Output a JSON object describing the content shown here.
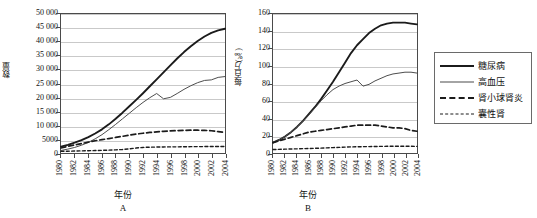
{
  "figure": {
    "panels": [
      {
        "letter": "A",
        "ylabel": "数量",
        "xlabel": "年份",
        "yticks": [
          "0",
          "5000",
          "10 000",
          "15 000",
          "20 000",
          "25 000",
          "30 000",
          "35 000",
          "40 000",
          "45 000",
          "50 000"
        ]
      },
      {
        "letter": "B",
        "ylabel": "每百万(‰)",
        "xlabel": "年份",
        "yticks": [
          "0",
          "20",
          "40",
          "60",
          "80",
          "100",
          "120",
          "140",
          "160"
        ]
      }
    ],
    "xticks": [
      "1980",
      "1982",
      "1984",
      "1986",
      "1988",
      "1990",
      "1992",
      "1994",
      "1996",
      "1998",
      "2000",
      "2002",
      "2004"
    ]
  },
  "legend": {
    "items": [
      {
        "label": "糖尿病",
        "style": "solid-thick",
        "color": "#1b1b1b"
      },
      {
        "label": "高血压",
        "style": "solid-thin",
        "color": "#4a4a4a"
      },
      {
        "label": "肾小球肾炎",
        "style": "dashed",
        "color": "#1b1b1b"
      },
      {
        "label": "囊性肾",
        "style": "dotted",
        "color": "#1b1b1b"
      }
    ]
  },
  "chart_data": [
    {
      "type": "line",
      "panel": "A",
      "title": "",
      "xlabel": "年份",
      "ylabel": "数量",
      "xlim": [
        1980,
        2004
      ],
      "ylim": [
        0,
        50000
      ],
      "grid": true,
      "legend_position": "right-outside",
      "x": [
        1980,
        1981,
        1982,
        1983,
        1984,
        1985,
        1986,
        1987,
        1988,
        1989,
        1990,
        1991,
        1992,
        1993,
        1994,
        1995,
        1996,
        1997,
        1998,
        1999,
        2000,
        2001,
        2002,
        2003,
        2004
      ],
      "series": [
        {
          "name": "糖尿病",
          "style": "solid-thick",
          "values": [
            2300,
            2900,
            3700,
            4600,
            5700,
            7000,
            8500,
            10300,
            12300,
            14500,
            16800,
            19100,
            21500,
            24000,
            26500,
            29000,
            31500,
            34000,
            36300,
            38400,
            40300,
            41900,
            43200,
            44100,
            44700
          ]
        },
        {
          "name": "高血压",
          "style": "solid-thin",
          "values": [
            900,
            1400,
            2000,
            2800,
            3800,
            5100,
            6600,
            8400,
            10300,
            12300,
            14300,
            16300,
            18200,
            19900,
            21400,
            19500,
            20000,
            21400,
            22900,
            24200,
            25300,
            26100,
            26300,
            27200,
            27500
          ]
        },
        {
          "name": "肾小球肾炎",
          "style": "dashed",
          "values": [
            1800,
            2400,
            2900,
            3400,
            3900,
            4400,
            4800,
            5200,
            5600,
            6000,
            6400,
            6800,
            7100,
            7400,
            7600,
            7800,
            7950,
            8050,
            8150,
            8200,
            8200,
            8150,
            8000,
            7700,
            7400
          ]
        },
        {
          "name": "囊性肾",
          "style": "dotted",
          "values": [
            600,
            650,
            700,
            760,
            820,
            880,
            950,
            1030,
            1120,
            1250,
            1500,
            1800,
            2000,
            2100,
            2150,
            2180,
            2200,
            2220,
            2250,
            2280,
            2300,
            2320,
            2330,
            2340,
            2350
          ]
        }
      ]
    },
    {
      "type": "line",
      "panel": "B",
      "title": "",
      "xlabel": "年份",
      "ylabel": "每百万(‰)",
      "xlim": [
        1980,
        2004
      ],
      "ylim": [
        0,
        160
      ],
      "grid": true,
      "legend_position": "right-outside",
      "x": [
        1980,
        1981,
        1982,
        1983,
        1984,
        1985,
        1986,
        1987,
        1988,
        1989,
        1990,
        1991,
        1992,
        1993,
        1994,
        1995,
        1996,
        1997,
        1998,
        1999,
        2000,
        2001,
        2002,
        2003,
        2004
      ],
      "series": [
        {
          "name": "糖尿病",
          "style": "solid-thick",
          "values": [
            12,
            15,
            19,
            24,
            30,
            37,
            45,
            53,
            62,
            72,
            82,
            93,
            104,
            115,
            124,
            131,
            138,
            143,
            147,
            149,
            150,
            150,
            150,
            149,
            148
          ]
        },
        {
          "name": "高血压",
          "style": "solid-thin",
          "values": [
            12,
            15,
            19,
            24,
            30,
            37,
            44,
            52,
            60,
            67,
            73,
            77,
            80,
            82,
            84,
            77,
            79,
            83,
            86,
            89,
            91,
            92,
            93,
            93,
            92
          ]
        },
        {
          "name": "肾小球肾炎",
          "style": "dashed",
          "values": [
            12,
            14,
            16,
            18,
            20,
            22,
            24,
            25,
            26,
            27,
            28,
            29,
            30,
            31,
            32,
            32,
            32,
            32,
            31,
            30,
            29,
            29,
            28,
            26,
            25
          ]
        },
        {
          "name": "囊性肾",
          "style": "dotted",
          "values": [
            4,
            4.2,
            4.4,
            4.6,
            4.8,
            5.0,
            5.2,
            5.4,
            5.6,
            5.9,
            6.2,
            6.5,
            6.8,
            7.0,
            7.2,
            7.3,
            7.4,
            7.5,
            7.6,
            7.7,
            7.8,
            7.8,
            7.8,
            7.7,
            7.6
          ]
        }
      ]
    }
  ]
}
